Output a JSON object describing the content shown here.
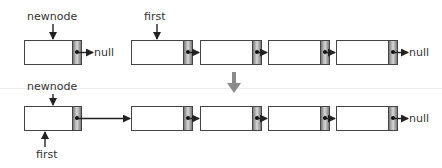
{
  "diagram": {
    "type": "linked-list-insert-at-front",
    "before": {
      "labels": {
        "newnode": "newnode",
        "first": "first",
        "null_new": "null",
        "null_end": "null"
      },
      "new_node": {
        "id": "newnode",
        "next": "null"
      },
      "list": [
        {
          "id": "n1"
        },
        {
          "id": "n2"
        },
        {
          "id": "n3"
        },
        {
          "id": "n4",
          "next": "null"
        }
      ]
    },
    "transition_arrow": {
      "direction": "down",
      "color": "#888888"
    },
    "after": {
      "labels": {
        "newnode": "newnode",
        "first": "first",
        "null_end": "null"
      },
      "list": [
        {
          "id": "newnode"
        },
        {
          "id": "n1"
        },
        {
          "id": "n2"
        },
        {
          "id": "n3"
        },
        {
          "id": "n4",
          "next": "null"
        }
      ]
    },
    "colors": {
      "border": "#444444",
      "pointer_fill": "#9a9a9a",
      "arrow": "#222222"
    }
  }
}
